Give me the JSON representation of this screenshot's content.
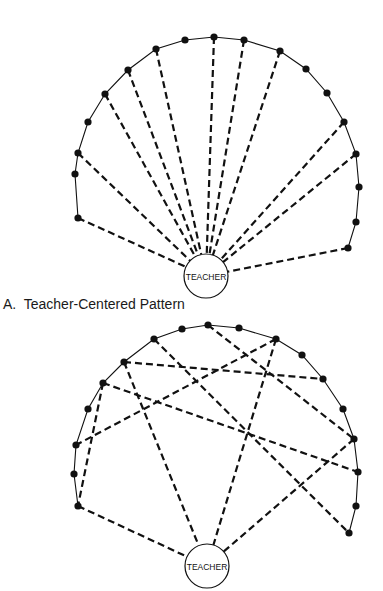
{
  "colors": {
    "ink": "#111111",
    "background": "#ffffff"
  },
  "diagrams": [
    {
      "id": "A",
      "caption": "A.  Teacher-Centered Pattern",
      "teacher": {
        "label": "TEACHER",
        "cx": 206,
        "cy": 276,
        "r": 22
      },
      "students": [
        [
          78,
          218
        ],
        [
          75,
          174
        ],
        [
          78,
          153
        ],
        [
          88,
          122
        ],
        [
          105,
          94
        ],
        [
          128,
          70
        ],
        [
          156,
          49
        ],
        [
          185,
          40
        ],
        [
          214,
          37
        ],
        [
          244,
          40
        ],
        [
          280,
          51
        ],
        [
          306,
          69
        ],
        [
          327,
          93
        ],
        [
          344,
          122
        ],
        [
          356,
          154
        ],
        [
          359,
          187
        ],
        [
          356,
          222
        ],
        [
          348,
          248
        ]
      ],
      "links": [
        {
          "from": 0,
          "to": "teacher"
        },
        {
          "from": 2,
          "to": "teacher"
        },
        {
          "from": 4,
          "to": "teacher"
        },
        {
          "from": 5,
          "to": "teacher"
        },
        {
          "from": 6,
          "to": "teacher"
        },
        {
          "from": 8,
          "to": "teacher"
        },
        {
          "from": 9,
          "to": "teacher"
        },
        {
          "from": 10,
          "to": "teacher"
        },
        {
          "from": 13,
          "to": "teacher"
        },
        {
          "from": 14,
          "to": "teacher"
        },
        {
          "from": 17,
          "to": "teacher"
        }
      ]
    },
    {
      "id": "B",
      "caption": "",
      "teacher": {
        "label": "TEACHER",
        "cx": 207,
        "cy": 566,
        "r": 22
      },
      "students": [
        [
          78,
          506
        ],
        [
          74,
          474
        ],
        [
          76,
          445
        ],
        [
          88,
          409
        ],
        [
          103,
          383
        ],
        [
          124,
          362
        ],
        [
          154,
          339
        ],
        [
          182,
          329
        ],
        [
          208,
          325
        ],
        [
          239,
          328
        ],
        [
          276,
          339
        ],
        [
          302,
          355
        ],
        [
          323,
          379
        ],
        [
          343,
          409
        ],
        [
          354,
          439
        ],
        [
          358,
          472
        ],
        [
          356,
          506
        ],
        [
          349,
          533
        ]
      ],
      "links": [
        {
          "from": 6,
          "to": 17
        },
        {
          "from": 8,
          "to": 14
        },
        {
          "from": 10,
          "to": 2
        },
        {
          "from": 10,
          "to": "teacher"
        },
        {
          "from": 5,
          "to": 12
        },
        {
          "from": 5,
          "to": "teacher"
        },
        {
          "from": 4,
          "to": 15
        },
        {
          "from": 4,
          "to": 0
        },
        {
          "from": 0,
          "to": "teacher"
        },
        {
          "from": 14,
          "to": "teacher"
        }
      ]
    }
  ]
}
